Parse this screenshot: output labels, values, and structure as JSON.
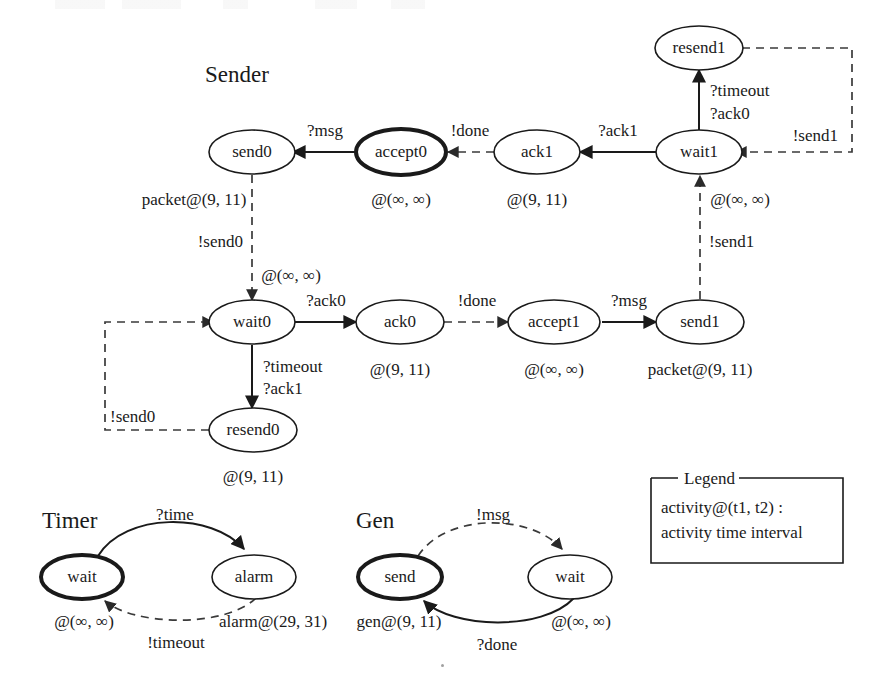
{
  "figure": {
    "kind": "timed-state-transition-diagram",
    "groups": [
      "Sender",
      "Timer",
      "Gen"
    ]
  },
  "sender": {
    "title": "Sender",
    "nodes": [
      {
        "id": "send0",
        "label": "send0",
        "bold": false,
        "timing": "packet@(9, 11)"
      },
      {
        "id": "accept0",
        "label": "accept0",
        "bold": true,
        "timing": "@(∞, ∞)"
      },
      {
        "id": "ack1",
        "label": "ack1",
        "bold": false,
        "timing": "@(9, 11)"
      },
      {
        "id": "wait1",
        "label": "wait1",
        "bold": false,
        "timing": "@(∞, ∞)"
      },
      {
        "id": "resend1",
        "label": "resend1",
        "bold": false,
        "timing": ""
      },
      {
        "id": "wait0",
        "label": "wait0",
        "bold": false,
        "timing": "@(∞, ∞)"
      },
      {
        "id": "ack0",
        "label": "ack0",
        "bold": false,
        "timing": "@(9, 11)"
      },
      {
        "id": "accept1",
        "label": "accept1",
        "bold": false,
        "timing": "@(∞, ∞)"
      },
      {
        "id": "send1",
        "label": "send1",
        "bold": false,
        "timing": "packet@(9, 11)"
      },
      {
        "id": "resend0",
        "label": "resend0",
        "bold": false,
        "timing": "@(9, 11)"
      }
    ],
    "edges": [
      {
        "from": "accept0",
        "to": "send0",
        "label": "?msg",
        "style": "solid"
      },
      {
        "from": "ack1",
        "to": "accept0",
        "label": "!done",
        "style": "dashed"
      },
      {
        "from": "wait1",
        "to": "ack1",
        "label": "?ack1",
        "style": "solid"
      },
      {
        "from": "wait1",
        "to": "resend1",
        "label": "?timeout\n?ack0",
        "style": "solid"
      },
      {
        "from": "resend1",
        "to": "wait1",
        "label": "!send1",
        "style": "dashed"
      },
      {
        "from": "send0",
        "to": "wait0",
        "label": "!send0",
        "style": "dashed"
      },
      {
        "from": "wait0",
        "to": "ack0",
        "label": "?ack0",
        "style": "solid"
      },
      {
        "from": "ack0",
        "to": "accept1",
        "label": "!done",
        "style": "dashed"
      },
      {
        "from": "accept1",
        "to": "send1",
        "label": "?msg",
        "style": "solid"
      },
      {
        "from": "send1",
        "to": "wait1",
        "label": "!send1",
        "style": "dashed"
      },
      {
        "from": "wait0",
        "to": "resend0",
        "label": "?timeout\n?ack1",
        "style": "solid"
      },
      {
        "from": "resend0",
        "to": "wait0",
        "label": "!send0",
        "style": "dashed"
      }
    ]
  },
  "timer": {
    "title": "Timer",
    "nodes": [
      {
        "id": "wait",
        "label": "wait",
        "bold": true,
        "timing": "@(∞, ∞)"
      },
      {
        "id": "alarm",
        "label": "alarm",
        "bold": false,
        "timing": "alarm@(29, 31)"
      }
    ],
    "edges": [
      {
        "from": "wait",
        "to": "alarm",
        "label": "?time",
        "style": "solid"
      },
      {
        "from": "alarm",
        "to": "wait",
        "label": "!timeout",
        "style": "dashed"
      }
    ]
  },
  "gen": {
    "title": "Gen",
    "nodes": [
      {
        "id": "send",
        "label": "send",
        "bold": true,
        "timing": "gen@(9, 11)"
      },
      {
        "id": "wait",
        "label": "wait",
        "bold": false,
        "timing": "@(∞, ∞)"
      }
    ],
    "edges": [
      {
        "from": "send",
        "to": "wait",
        "label": "!msg",
        "style": "dashed"
      },
      {
        "from": "wait",
        "to": "send",
        "label": "?done",
        "style": "solid"
      }
    ]
  },
  "legend": {
    "title": "Legend",
    "lines": [
      "activity@(t1, t2) :",
      "activity time interval"
    ]
  }
}
